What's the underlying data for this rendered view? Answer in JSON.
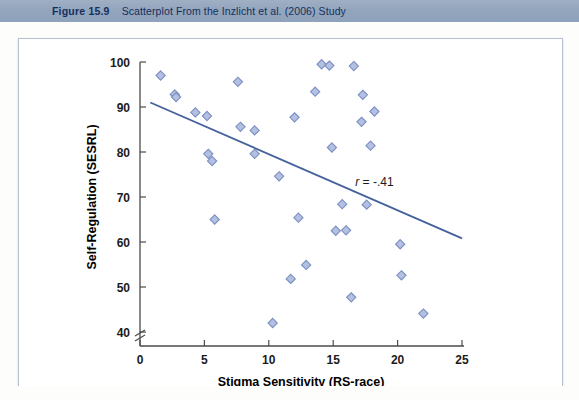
{
  "header": {
    "figure_number": "Figure 15.9",
    "title": "Scatterplot From the Inzlicht et al. (2006) Study"
  },
  "chart_data": {
    "type": "scatter",
    "title": "Scatterplot From the Inzlicht et al. (2006) Study",
    "xlabel": "Stigma Sensitivity (RS-race)",
    "ylabel": "Self-Regulation (SESRL)",
    "xlim": [
      0,
      25
    ],
    "ylim": [
      40,
      100
    ],
    "xticks": [
      0,
      5,
      10,
      15,
      20,
      25
    ],
    "yticks": [
      40,
      50,
      60,
      70,
      80,
      90,
      100
    ],
    "grid": false,
    "legend": null,
    "y_axis_break": true,
    "annotations": [
      {
        "name": "correlation",
        "text_prefix": "r",
        "text_rest": " = -.41",
        "x": 18.2,
        "y": 72.5
      }
    ],
    "series": [
      {
        "name": "Participants",
        "marker": "diamond",
        "marker_fill": "#b3c0e0",
        "marker_stroke": "#7b8fc4",
        "points": [
          [
            1.6,
            97.0
          ],
          [
            2.7,
            92.8
          ],
          [
            2.8,
            92.2
          ],
          [
            4.3,
            88.8
          ],
          [
            5.2,
            88.0
          ],
          [
            5.3,
            79.6
          ],
          [
            5.6,
            78.0
          ],
          [
            5.8,
            65.0
          ],
          [
            7.6,
            95.6
          ],
          [
            7.8,
            85.6
          ],
          [
            8.9,
            84.8
          ],
          [
            8.9,
            79.6
          ],
          [
            10.3,
            42.0
          ],
          [
            10.8,
            74.6
          ],
          [
            11.7,
            51.8
          ],
          [
            12.0,
            87.7
          ],
          [
            12.3,
            65.4
          ],
          [
            12.9,
            54.9
          ],
          [
            13.6,
            93.4
          ],
          [
            14.1,
            99.5
          ],
          [
            14.7,
            99.2
          ],
          [
            14.9,
            81.0
          ],
          [
            15.2,
            62.5
          ],
          [
            15.7,
            68.4
          ],
          [
            16.0,
            62.6
          ],
          [
            16.4,
            47.7
          ],
          [
            16.6,
            99.1
          ],
          [
            17.2,
            86.7
          ],
          [
            17.3,
            92.7
          ],
          [
            17.6,
            68.3
          ],
          [
            17.9,
            81.4
          ],
          [
            18.2,
            89.0
          ],
          [
            20.2,
            59.5
          ],
          [
            20.3,
            52.6
          ],
          [
            22.0,
            44.1
          ]
        ]
      }
    ],
    "trendline": {
      "name": "regression-line",
      "color": "#45619c",
      "x0": 0.8,
      "y0": 91.0,
      "x1": 25.0,
      "y1": 60.8,
      "r": "-.41"
    }
  }
}
